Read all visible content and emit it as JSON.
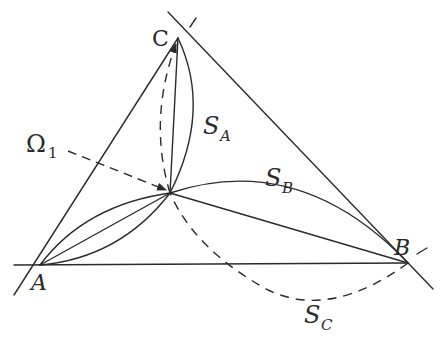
{
  "diagram": {
    "type": "geometric-construction",
    "colors": {
      "stroke": "#2b2b2b",
      "text": "#2a2a2a",
      "background": "#ffffff"
    },
    "points": {
      "A": {
        "label": "A",
        "x": 40,
        "y": 265
      },
      "B": {
        "label": "B",
        "x": 408,
        "y": 263
      },
      "C": {
        "label": "C",
        "x": 178,
        "y": 38
      },
      "Omega1": {
        "label": "Ω",
        "subscript": "1",
        "x": 170,
        "y": 193
      }
    },
    "labels": {
      "A": "A",
      "B": "B",
      "C": "C",
      "omega": "Ω",
      "omega_sub": "1",
      "S_A": "S",
      "S_A_sub": "A",
      "S_B": "S",
      "S_B_sub": "B",
      "S_C": "S",
      "S_C_sub": "C"
    },
    "circles": [
      {
        "name": "S_A",
        "through": [
          "C",
          "Omega1"
        ],
        "style": "solid"
      },
      {
        "name": "S_B",
        "through": [
          "A",
          "Omega1",
          "B"
        ],
        "style": "solid"
      },
      {
        "name": "S_C",
        "through": [
          "B",
          "Omega1",
          "C"
        ],
        "style": "dashed"
      }
    ],
    "segments": [
      "AB",
      "BC",
      "CA",
      "A-Omega1",
      "B-Omega1",
      "C-Omega1"
    ]
  }
}
